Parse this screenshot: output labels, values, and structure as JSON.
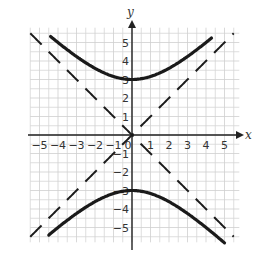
{
  "chart_data": {
    "type": "line",
    "title": "",
    "xlabel": "x",
    "ylabel": "y",
    "xlim": [
      -5.5,
      5.8
    ],
    "ylim": [
      -5.8,
      5.8
    ],
    "grid": true,
    "x_ticks": [
      "−5",
      "−4",
      "−3",
      "−2",
      "−1",
      "0",
      "1",
      "2",
      "3",
      "4",
      "5"
    ],
    "y_ticks": [
      "5",
      "4",
      "3",
      "2",
      "1",
      "−1",
      "−2",
      "−3",
      "−4",
      "−5"
    ],
    "equation": "y^2/9 - x^2/9 = 1",
    "series": [
      {
        "name": "upper branch",
        "style": "solid",
        "function": "y = sqrt(9 + x^2)",
        "x_range": [
          -4.4,
          4.3
        ],
        "vertex": [
          0,
          3
        ]
      },
      {
        "name": "lower branch",
        "style": "solid",
        "function": "y = -sqrt(9 + x^2)",
        "x_range": [
          -4.5,
          5.0
        ],
        "vertex": [
          0,
          -3
        ]
      },
      {
        "name": "asymptote 1",
        "style": "dashed",
        "function": "y = x",
        "x_range": [
          -5.5,
          5.5
        ]
      },
      {
        "name": "asymptote 2",
        "style": "dashed",
        "function": "y = -x",
        "x_range": [
          -5.5,
          5.5
        ]
      }
    ]
  },
  "labels": {
    "x_axis": "x",
    "y_axis": "y"
  }
}
